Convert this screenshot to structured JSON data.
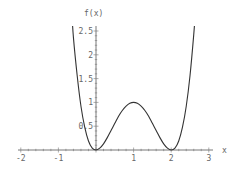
{
  "chart_data": {
    "type": "line",
    "title": "",
    "xlabel": "x",
    "ylabel": "f(x)",
    "xlim": [
      -2,
      3
    ],
    "ylim": [
      0,
      2.6
    ],
    "x_ticks": [
      -2,
      -1,
      1,
      2,
      3
    ],
    "x_tick_labels": [
      "-2",
      "-1",
      "1",
      "2",
      "3"
    ],
    "y_ticks": [
      0.5,
      1,
      1.5,
      2,
      2.5
    ],
    "y_tick_labels": [
      "0.5",
      "1",
      "1.5",
      "2",
      "2.5"
    ],
    "grid": false,
    "legend": null,
    "series": [
      {
        "name": "f(x)",
        "x": [
          -0.65,
          -0.6,
          -0.5,
          -0.4,
          -0.3,
          -0.2,
          -0.1,
          0,
          0.1,
          0.2,
          0.3,
          0.4,
          0.5,
          0.6,
          0.7,
          0.8,
          0.9,
          1.0,
          1.1,
          1.2,
          1.3,
          1.4,
          1.5,
          1.6,
          1.7,
          1.8,
          1.9,
          2.0,
          2.1,
          2.2,
          2.3,
          2.4,
          2.5,
          2.6,
          2.65
        ],
        "values": [
          2.97,
          2.36,
          1.56,
          0.92,
          0.48,
          0.19,
          0.04,
          0,
          0.04,
          0.13,
          0.26,
          0.41,
          0.56,
          0.71,
          0.83,
          0.92,
          0.98,
          1.0,
          0.98,
          0.92,
          0.83,
          0.71,
          0.56,
          0.41,
          0.26,
          0.13,
          0.04,
          0,
          0.04,
          0.19,
          0.48,
          0.92,
          1.56,
          2.43,
          2.97
        ],
        "color": "#333333"
      }
    ]
  },
  "axes": {
    "x_label": "x",
    "y_label": "f(x)"
  }
}
